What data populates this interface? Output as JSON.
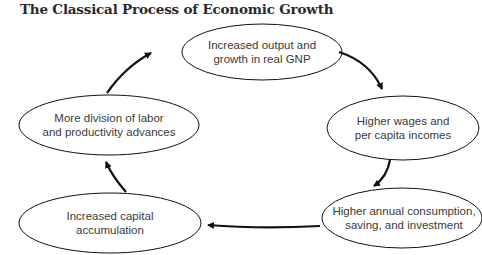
{
  "title": "The Classical Process of Economic Growth",
  "colors": {
    "stroke": "#111111",
    "text": "#3a3a3a",
    "title": "#2a2a2a",
    "background": "#ffffff"
  },
  "nodes": [
    {
      "id": "output",
      "lines": [
        "Increased output and",
        "growth in real GNP"
      ]
    },
    {
      "id": "wages",
      "lines": [
        "Higher wages and",
        "per capita incomes"
      ]
    },
    {
      "id": "consumption",
      "lines": [
        "Higher annual consumption,",
        "saving, and investment"
      ]
    },
    {
      "id": "capital",
      "lines": [
        "Increased capital",
        "accumulation"
      ]
    },
    {
      "id": "division",
      "lines": [
        "More division of labor",
        "and productivity advances"
      ]
    }
  ],
  "edges": [
    {
      "from": "output",
      "to": "wages"
    },
    {
      "from": "wages",
      "to": "consumption"
    },
    {
      "from": "consumption",
      "to": "capital"
    },
    {
      "from": "capital",
      "to": "division"
    },
    {
      "from": "division",
      "to": "output"
    }
  ]
}
